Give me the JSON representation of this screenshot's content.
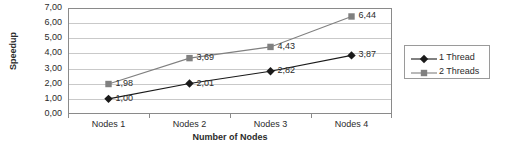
{
  "chart_data": {
    "type": "line",
    "title": "",
    "xlabel": "Number of Nodes",
    "ylabel": "Speedup",
    "categories": [
      "Nodes 1",
      "Nodes 2",
      "Nodes 3",
      "Nodes 4"
    ],
    "ylim": [
      0,
      7
    ],
    "ytick_labels": [
      "7,00",
      "6,00",
      "5,00",
      "4,00",
      "3,00",
      "2,00",
      "1,00",
      "0,00"
    ],
    "ytick_values": [
      7,
      6,
      5,
      4,
      3,
      2,
      1,
      0
    ],
    "grid": "horizontal",
    "legend_position": "right",
    "decimal_separator": ",",
    "series": [
      {
        "name": "1 Thread",
        "marker": "diamond",
        "color": "#1a1a1a",
        "values": [
          1.0,
          2.01,
          2.82,
          3.87
        ],
        "labels": [
          "1,00",
          "2,01",
          "2,82",
          "3,87"
        ]
      },
      {
        "name": "2 Threads",
        "marker": "square",
        "color": "#808080",
        "values": [
          1.98,
          3.69,
          4.43,
          6.44
        ],
        "labels": [
          "1,98",
          "3,69",
          "4,43",
          "6,44"
        ]
      }
    ]
  },
  "legend": {
    "items": [
      {
        "label": "1 Thread"
      },
      {
        "label": "2 Threads"
      }
    ]
  }
}
